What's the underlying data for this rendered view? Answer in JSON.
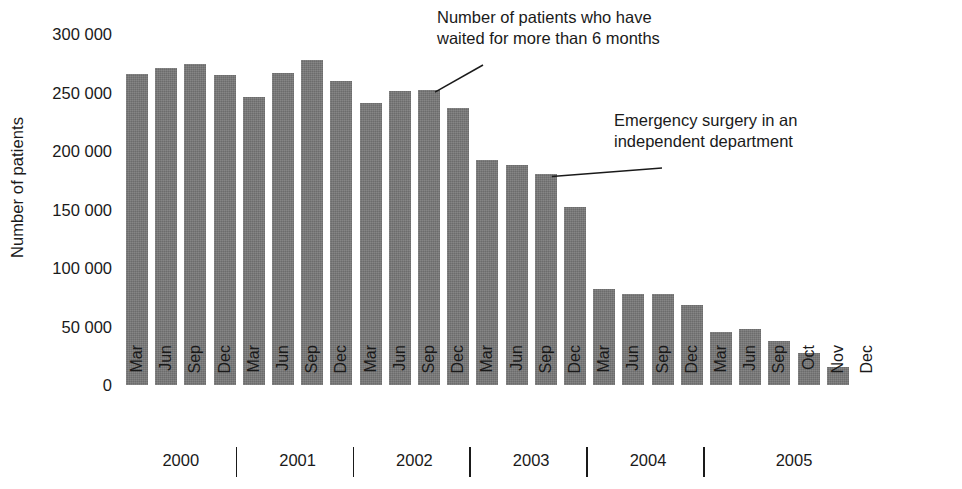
{
  "chart_data": {
    "type": "bar",
    "title": "",
    "xlabel": "",
    "ylabel": "Number of patients",
    "ylim": [
      0,
      300000
    ],
    "ytick_step": 50000,
    "grid": false,
    "legend": "none",
    "bar_color": "#787878",
    "background_color": "#ffffff",
    "ytick_labels": [
      "300 000",
      "250 000",
      "200 000",
      "150 000",
      "100 000",
      "50 000",
      "0"
    ],
    "ytick_values": [
      300000,
      250000,
      200000,
      150000,
      100000,
      50000,
      0
    ],
    "categories": [
      "Mar 2000",
      "Jun 2000",
      "Sep 2000",
      "Dec 2000",
      "Mar 2001",
      "Jun 2001",
      "Sep 2001",
      "Dec 2001",
      "Mar 2002",
      "Jun 2002",
      "Sep 2002",
      "Dec 2002",
      "Mar 2003",
      "Jun 2003",
      "Sep 2003",
      "Dec 2003",
      "Mar 2004",
      "Jun 2004",
      "Sep 2004",
      "Dec 2004",
      "Mar 2005",
      "Jun 2005",
      "Sep 2005",
      "Oct 2005",
      "Nov 2005",
      "Dec 2005"
    ],
    "values": [
      266000,
      271000,
      274000,
      265000,
      246000,
      267000,
      278000,
      260000,
      241000,
      251000,
      252000,
      237000,
      192000,
      188000,
      180000,
      152000,
      82000,
      78000,
      78000,
      68000,
      45000,
      48000,
      38000,
      27000,
      15000,
      0
    ],
    "month_labels": [
      "Mar",
      "Jun",
      "Sep",
      "Dec",
      "Mar",
      "Jun",
      "Sep",
      "Dec",
      "Mar",
      "Jun",
      "Sep",
      "Dec",
      "Mar",
      "Jun",
      "Sep",
      "Dec",
      "Mar",
      "Jun",
      "Sep",
      "Dec",
      "Mar",
      "Jun",
      "Sep",
      "Oct",
      "Nov",
      "Dec"
    ],
    "year_groups": [
      {
        "label": "2000",
        "start_index": 0,
        "count": 4
      },
      {
        "label": "2001",
        "start_index": 4,
        "count": 4
      },
      {
        "label": "2002",
        "start_index": 8,
        "count": 4
      },
      {
        "label": "2003",
        "start_index": 12,
        "count": 4
      },
      {
        "label": "2004",
        "start_index": 16,
        "count": 4
      },
      {
        "label": "2005",
        "start_index": 20,
        "count": 6
      }
    ],
    "annotations": [
      {
        "id": "waiting",
        "text": "Number of patients who have\nwaited for more than 6 months",
        "target_index": 10
      },
      {
        "id": "emergency",
        "text": "Emergency surgery in an\nindependent department",
        "target_index": 14
      }
    ]
  }
}
